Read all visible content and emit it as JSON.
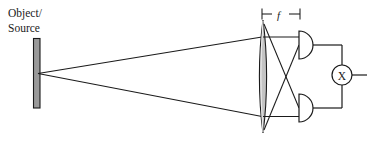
{
  "figure": {
    "kind": "optical-diagram",
    "title_visible": false,
    "background_color": "#ffffff",
    "stroke_color": "#1a1a1a",
    "fill_gray": "#9a9a9a",
    "lens_fill": "#c8c8c8"
  },
  "labels": {
    "object_line1": "Object/",
    "object_line2": "Source",
    "focal_length": "f",
    "multiplier": "X"
  },
  "components": {
    "source_bar": {
      "name": "object-source-bar",
      "x": 33,
      "y": 38,
      "width": 7,
      "height": 70
    },
    "lens": {
      "name": "converging-lens",
      "center_x": 263,
      "top_y": 20,
      "bottom_y": 133,
      "half_width": 5
    },
    "detector_top": {
      "name": "photodetector-top",
      "flat_x": 299,
      "center_y": 45,
      "radius": 14
    },
    "detector_bottom": {
      "name": "photodetector-bottom",
      "flat_x": 299,
      "center_y": 108,
      "radius": 14
    },
    "multiplier_node": {
      "name": "multiplier-node",
      "center_x": 342,
      "center_y": 75,
      "radius": 10
    }
  },
  "dimension": {
    "name": "focal-length-dimension",
    "y": 14,
    "x_start": 262,
    "x_end": 300,
    "label": "f"
  },
  "rays": {
    "source_apex_x": 38,
    "source_apex_y": 73,
    "upper_hit_y": 37,
    "lower_hit_y": 116
  }
}
